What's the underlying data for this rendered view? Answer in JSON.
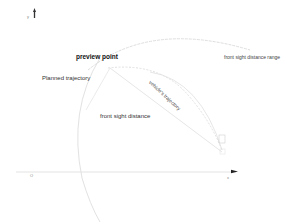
{
  "diagram": {
    "axes": {
      "y_label": "y",
      "x_label": "x",
      "origin_label": "O"
    },
    "labels": {
      "preview_point": "preview point",
      "planned_trajectory": "Planned trajectory",
      "vehicle_trajectory": "vehicle's trajectory",
      "front_sight_distance": "front sight distance",
      "front_sight_distance_range": "front sight distance range"
    },
    "colors": {
      "arc": "#d8d8d8",
      "axis": "#dcdcdc",
      "text": "#222222",
      "arrow": "#222222"
    }
  }
}
